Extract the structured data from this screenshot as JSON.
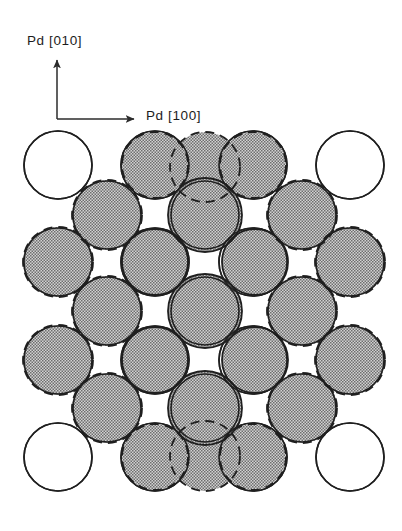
{
  "figure": {
    "background_color": "#ffffff"
  },
  "axes": {
    "vertical": {
      "label": "Pd [010]",
      "direction": "up",
      "origin_x": 57,
      "origin_y": 119,
      "tip_x": 57,
      "tip_y": 58,
      "label_x": 27,
      "label_y": 40,
      "color": "#2b2b2b"
    },
    "horizontal": {
      "label": "Pd [100]",
      "direction": "right",
      "origin_x": 57,
      "origin_y": 119,
      "tip_x": 137,
      "tip_y": 119,
      "label_x": 146,
      "label_y": 115,
      "color": "#2b2b2b"
    }
  },
  "substrate": {
    "name": "Pd",
    "style": "open circle, thin solid dark outline, white fill",
    "fill": "#ffffff",
    "stroke": "#1f1f1f",
    "stroke_width": 1.6,
    "radius": 34,
    "lattice_spacing": 97.5,
    "circles": [
      {
        "cx": 58,
        "cy": 165
      },
      {
        "cx": 155,
        "cy": 165
      },
      {
        "cx": 253,
        "cy": 165
      },
      {
        "cx": 350,
        "cy": 165
      },
      {
        "cx": 58,
        "cy": 262
      },
      {
        "cx": 155,
        "cy": 262
      },
      {
        "cx": 253,
        "cy": 262
      },
      {
        "cx": 350,
        "cy": 262
      },
      {
        "cx": 58,
        "cy": 360
      },
      {
        "cx": 155,
        "cy": 360
      },
      {
        "cx": 253,
        "cy": 360
      },
      {
        "cx": 350,
        "cy": 360
      },
      {
        "cx": 58,
        "cy": 457
      },
      {
        "cx": 155,
        "cy": 457
      },
      {
        "cx": 253,
        "cy": 457
      },
      {
        "cx": 350,
        "cy": 457
      },
      {
        "cx": 107,
        "cy": 215
      },
      {
        "cx": 205,
        "cy": 215
      },
      {
        "cx": 302,
        "cy": 215
      },
      {
        "cx": 107,
        "cy": 311
      },
      {
        "cx": 205,
        "cy": 311
      },
      {
        "cx": 302,
        "cy": 311
      },
      {
        "cx": 107,
        "cy": 408
      },
      {
        "cx": 205,
        "cy": 408
      },
      {
        "cx": 302,
        "cy": 408
      }
    ]
  },
  "overlayer": {
    "name": "adsorbate overlayer",
    "style": "gray stippled disc, dashed dark outline",
    "fill": "#a9a9a9",
    "stroke": "#1f1f1f",
    "stroke_width": 1.8,
    "dash_pattern": "9,6",
    "radius_large": 37,
    "radius_small": 33,
    "lattice_spacing": 97.5,
    "circles": [
      {
        "cx": 205,
        "cy": 215,
        "r": 37,
        "dashed": false
      },
      {
        "cx": 205,
        "cy": 311,
        "r": 37,
        "dashed": false
      },
      {
        "cx": 205,
        "cy": 408,
        "r": 37,
        "dashed": false
      },
      {
        "cx": 155,
        "cy": 262,
        "r": 33,
        "dashed": false
      },
      {
        "cx": 255,
        "cy": 262,
        "r": 33,
        "dashed": false
      },
      {
        "cx": 155,
        "cy": 360,
        "r": 33,
        "dashed": false
      },
      {
        "cx": 255,
        "cy": 360,
        "r": 33,
        "dashed": false
      },
      {
        "cx": 205,
        "cy": 167,
        "r": 35,
        "dashed": true
      },
      {
        "cx": 205,
        "cy": 456,
        "r": 35,
        "dashed": true
      },
      {
        "cx": 107,
        "cy": 215,
        "r": 35,
        "dashed": true
      },
      {
        "cx": 302,
        "cy": 215,
        "r": 35,
        "dashed": true
      },
      {
        "cx": 107,
        "cy": 311,
        "r": 35,
        "dashed": true
      },
      {
        "cx": 302,
        "cy": 311,
        "r": 35,
        "dashed": true
      },
      {
        "cx": 107,
        "cy": 408,
        "r": 35,
        "dashed": true
      },
      {
        "cx": 302,
        "cy": 408,
        "r": 35,
        "dashed": true
      },
      {
        "cx": 58,
        "cy": 262,
        "r": 35,
        "dashed": true
      },
      {
        "cx": 58,
        "cy": 360,
        "r": 35,
        "dashed": true
      },
      {
        "cx": 350,
        "cy": 262,
        "r": 35,
        "dashed": true
      },
      {
        "cx": 350,
        "cy": 360,
        "r": 35,
        "dashed": true
      },
      {
        "cx": 155,
        "cy": 165,
        "r": 33,
        "dashed": true
      },
      {
        "cx": 253,
        "cy": 165,
        "r": 33,
        "dashed": true
      },
      {
        "cx": 155,
        "cy": 457,
        "r": 33,
        "dashed": true
      },
      {
        "cx": 253,
        "cy": 457,
        "r": 33,
        "dashed": true
      }
    ]
  },
  "chart_data": {
    "type": "scatter",
    "xlabel": "Pd [100]",
    "ylabel": "Pd [010]",
    "series": [
      {
        "name": "Pd substrate atoms",
        "marker": "open circle",
        "radius_px": 34,
        "x": [
          58,
          155,
          253,
          350,
          58,
          155,
          253,
          350,
          58,
          155,
          253,
          350,
          58,
          155,
          253,
          350,
          107,
          205,
          302,
          107,
          205,
          302,
          107,
          205,
          302
        ],
        "y": [
          165,
          165,
          165,
          165,
          262,
          262,
          262,
          262,
          360,
          360,
          360,
          360,
          457,
          457,
          457,
          457,
          215,
          215,
          215,
          311,
          311,
          311,
          408,
          408,
          408
        ]
      },
      {
        "name": "Overlayer atoms",
        "marker": "gray stippled circle, dashed outline",
        "radius_px": 35,
        "x": [
          205,
          205,
          205,
          155,
          255,
          155,
          255,
          205,
          205,
          107,
          302,
          107,
          302,
          107,
          302,
          58,
          58,
          350,
          350,
          155,
          253,
          155,
          253
        ],
        "y": [
          215,
          311,
          408,
          262,
          262,
          360,
          360,
          167,
          456,
          215,
          215,
          311,
          311,
          408,
          408,
          262,
          360,
          262,
          360,
          165,
          165,
          457,
          457
        ]
      }
    ],
    "grid": false,
    "legend": false
  }
}
